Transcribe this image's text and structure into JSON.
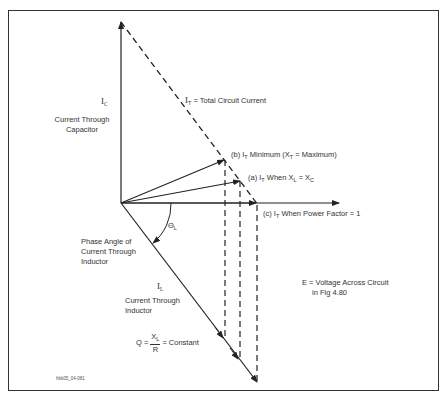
{
  "diagram": {
    "type": "phasor diagram",
    "labels": {
      "ic_symbol": "I",
      "ic_sub": "C",
      "ic_desc_line1": "Current Through",
      "ic_desc_line2": "Capacitor",
      "it_symbol": "I",
      "it_sub": "T",
      "it_desc": "= Total Circuit Current",
      "b_prefix": "(b) I",
      "b_sub": "T",
      "b_mid": " Minimum (X",
      "b_sub2": "T",
      "b_suffix": " = Maximum)",
      "a_prefix": "(a) I",
      "a_sub": "T",
      "a_mid": " When X",
      "a_sub2": "L",
      "a_eq": " = X",
      "a_sub3": "C",
      "c_prefix": "(c) I",
      "c_sub": "T",
      "c_suffix": " When Power Factor = 1",
      "theta_symbol": "Θ",
      "theta_sub": "L",
      "phase_line1": "Phase Angle of",
      "phase_line2": "Current Through",
      "phase_line3": "Inductor",
      "il_symbol": "I",
      "il_sub": "L",
      "il_desc_line1": "Current Through",
      "il_desc_line2": "Inductor",
      "e_line1": "E = Voltage Across Circuit",
      "e_line2": "in Fig 4.80",
      "q_left": "Q =",
      "q_num": "X",
      "q_num_sub": "L",
      "q_den": "R",
      "q_right": "= Constant",
      "figure_id": "hbk05_04-081"
    },
    "colors": {
      "line": "#222222",
      "text": "#333333",
      "frame": "#333333"
    }
  }
}
